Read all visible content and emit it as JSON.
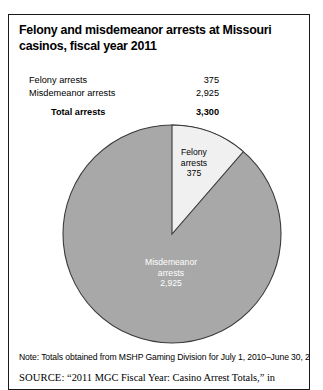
{
  "figure": {
    "title": "Felony and misdemeanor arrests at Missouri casinos, fiscal year 2011",
    "note": "Note: Totals obtained from MSHP Gaming Division for July 1, 2010–June 30, 2011",
    "source_label": "SOURCE:",
    "source_text": "“2011 MGC Fiscal Year: Casino Arrest Totals,” in"
  },
  "table": {
    "rows": [
      {
        "label": "Felony arrests",
        "value": "375"
      },
      {
        "label": "Misdemeanor arrests",
        "value": "2,925"
      }
    ],
    "total": {
      "label": "Total arrests",
      "value": "3,300"
    }
  },
  "chart_data": {
    "type": "pie",
    "title": "Felony and misdemeanor arrests at Missouri casinos, fiscal year 2011",
    "categories": [
      "Felony arrests",
      "Misdemeanor arrests"
    ],
    "values": [
      375,
      2925
    ],
    "total": 3300,
    "percentages": [
      11.4,
      88.6
    ],
    "start_angle_deg": 0,
    "direction": "clockwise",
    "legend": "none",
    "labels_inside": true,
    "slices": [
      {
        "name": "Felony arrests",
        "value": 375,
        "percent": 11.4,
        "color": "#f0f0f0",
        "label_line1": "Felony",
        "label_line2": "arrests",
        "label_line3": "375"
      },
      {
        "name": "Misdemeanor arrests",
        "value": 2925,
        "percent": 88.6,
        "color": "#a8a8a8",
        "label_line1": "Misdemeanor",
        "label_line2": "arrests",
        "label_line3": "2,925"
      }
    ]
  },
  "colors": {
    "felony_slice": "#f0f0f0",
    "misdemeanor_slice": "#a8a8a8",
    "outline": "#3a3a3a",
    "frame": "#1a1a1a"
  }
}
